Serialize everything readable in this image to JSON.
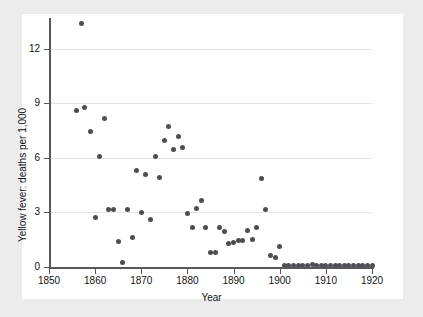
{
  "chart_data": {
    "type": "scatter",
    "title": "",
    "xlabel": "Year",
    "ylabel": "Yellow fever: deaths per 1,000",
    "xlim": [
      1850,
      1920
    ],
    "ylim": [
      0,
      13.6
    ],
    "grid": true,
    "legend": null,
    "xticks": [
      1850,
      1860,
      1870,
      1880,
      1890,
      1900,
      1910,
      1920
    ],
    "yticks": [
      0,
      3,
      6,
      9,
      12
    ],
    "marker": {
      "shape": "circle",
      "color": "#4d4d52",
      "size": 5
    },
    "series": [
      {
        "name": "Yellow fever deaths per 1,000",
        "points": [
          [
            1856,
            8.6
          ],
          [
            1857,
            13.4
          ],
          [
            1857.6,
            8.8
          ],
          [
            1859,
            7.45
          ],
          [
            1860,
            2.75
          ],
          [
            1861,
            6.1
          ],
          [
            1862,
            8.2
          ],
          [
            1863,
            3.15
          ],
          [
            1864,
            3.15
          ],
          [
            1865,
            1.4
          ],
          [
            1866,
            0.25
          ],
          [
            1867,
            3.15
          ],
          [
            1868,
            1.6
          ],
          [
            1869,
            5.3
          ],
          [
            1870,
            3.0
          ],
          [
            1871,
            5.1
          ],
          [
            1872,
            2.6
          ],
          [
            1873,
            6.1
          ],
          [
            1874,
            4.9
          ],
          [
            1875,
            6.95
          ],
          [
            1876,
            7.75
          ],
          [
            1877,
            6.45
          ],
          [
            1878,
            7.2
          ],
          [
            1879,
            6.6
          ],
          [
            1880,
            2.95
          ],
          [
            1881,
            2.2
          ],
          [
            1882,
            3.2
          ],
          [
            1883,
            3.65
          ],
          [
            1884,
            2.2
          ],
          [
            1885,
            0.8
          ],
          [
            1886,
            0.8
          ],
          [
            1887,
            2.15
          ],
          [
            1888,
            1.95
          ],
          [
            1889,
            1.3
          ],
          [
            1890,
            1.35
          ],
          [
            1891,
            1.45
          ],
          [
            1892,
            1.45
          ],
          [
            1893,
            2.0
          ],
          [
            1894,
            1.5
          ],
          [
            1895,
            2.2
          ],
          [
            1896,
            4.85
          ],
          [
            1897,
            3.15
          ],
          [
            1898,
            0.62
          ],
          [
            1899,
            0.5
          ],
          [
            1900,
            1.15
          ],
          [
            1901,
            0.1
          ],
          [
            1902,
            0.08
          ],
          [
            1903,
            0.08
          ],
          [
            1904,
            0.07
          ],
          [
            1905,
            0.08
          ],
          [
            1906,
            0.07
          ],
          [
            1907,
            0.12
          ],
          [
            1908,
            0.08
          ],
          [
            1909,
            0.08
          ],
          [
            1910,
            0.08
          ],
          [
            1911,
            0.08
          ],
          [
            1912,
            0.08
          ],
          [
            1913,
            0.08
          ],
          [
            1914,
            0.08
          ],
          [
            1915,
            0.08
          ],
          [
            1916,
            0.08
          ],
          [
            1917,
            0.08
          ],
          [
            1918,
            0.08
          ],
          [
            1919,
            0.08
          ],
          [
            1920,
            0.08
          ]
        ]
      }
    ]
  },
  "axes": {
    "x_title": "Year",
    "y_title": "Yellow fever: deaths per 1,000",
    "x_tick_labels": [
      "1850",
      "1860",
      "1870",
      "1880",
      "1890",
      "1900",
      "1910",
      "1920"
    ],
    "y_tick_labels": [
      "0",
      "3",
      "6",
      "9",
      "12"
    ]
  },
  "colors": {
    "marker": "#4d4d52",
    "axis": "#58585a",
    "grid": "#e4e4e6",
    "page": "#ececed",
    "canvas": "#ffffff"
  }
}
